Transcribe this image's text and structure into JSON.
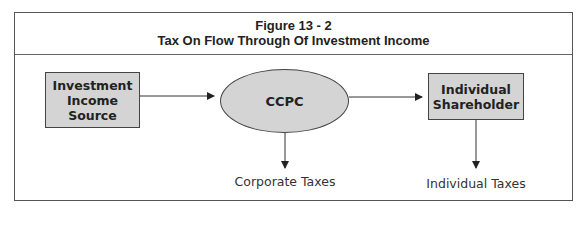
{
  "figure": {
    "number": "Figure 13 - 2",
    "title": "Tax On Flow Through Of Investment Income"
  },
  "nodes": {
    "source": {
      "lines": [
        "Investment",
        "Income",
        "Source"
      ],
      "shape": "rectangle"
    },
    "ccpc": {
      "label": "CCPC",
      "shape": "ellipse"
    },
    "shareholder": {
      "lines": [
        "Individual",
        "Shareholder"
      ],
      "shape": "rectangle"
    }
  },
  "outputs": {
    "corporate": "Corporate Taxes",
    "individual": "Individual Taxes"
  },
  "edges": [
    {
      "from": "Investment Income Source",
      "to": "CCPC"
    },
    {
      "from": "CCPC",
      "to": "Individual Shareholder"
    },
    {
      "from": "CCPC",
      "to": "Corporate Taxes"
    },
    {
      "from": "Individual Shareholder",
      "to": "Individual Taxes"
    }
  ],
  "colors": {
    "node_fill": "#d4d4d4",
    "border": "#444444"
  }
}
